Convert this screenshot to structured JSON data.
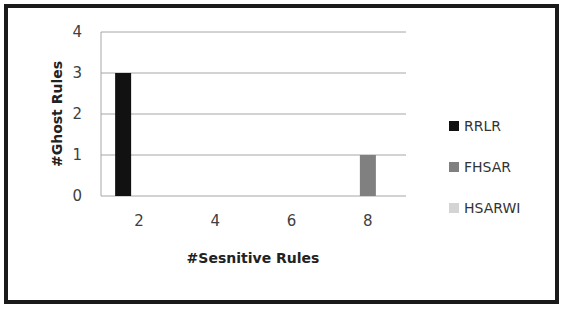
{
  "chart_data": {
    "type": "bar",
    "title": "",
    "xlabel": "#Sesnitive Rules",
    "ylabel": "#Ghost Rules",
    "categories": [
      "2",
      "4",
      "6",
      "8"
    ],
    "series": [
      {
        "name": "RRLR",
        "color": "#111111",
        "values": [
          3,
          0,
          0,
          0
        ]
      },
      {
        "name": "FHSAR",
        "color": "#808080",
        "values": [
          0,
          0,
          0,
          1
        ]
      },
      {
        "name": "HSARWI",
        "color": "#d4d4d4",
        "values": [
          0,
          0,
          0,
          0
        ]
      }
    ],
    "ylim": [
      0,
      4
    ],
    "yticks": [
      "0",
      "1",
      "2",
      "3",
      "4"
    ],
    "grid": true,
    "legend_position": "right"
  }
}
